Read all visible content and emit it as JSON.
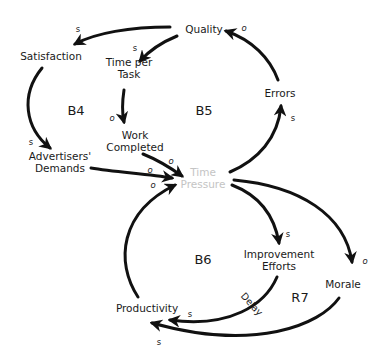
{
  "diagram": {
    "type": "causal-loop-diagram",
    "nodes": {
      "quality": "Quality",
      "satisfaction": "Satisfaction",
      "time_per_task_1": "Time per",
      "time_per_task_2": "Task",
      "work_completed_1": "Work",
      "work_completed_2": "Completed",
      "advertisers_demands_1": "Advertisers'",
      "advertisers_demands_2": "Demands",
      "errors": "Errors",
      "time_pressure_1": "Time",
      "time_pressure_2": "Pressure",
      "improvement_efforts_1": "Improvement",
      "improvement_efforts_2": "Efforts",
      "productivity": "Productivity",
      "morale": "Morale"
    },
    "loops": {
      "b4": "B4",
      "b5": "B5",
      "b6": "B6",
      "r7": "R7"
    },
    "delay_label": "Delay",
    "links": [
      {
        "from": "Quality",
        "to": "Satisfaction",
        "polarity": "s"
      },
      {
        "from": "Quality",
        "to": "Time per Task",
        "polarity": "s"
      },
      {
        "from": "Satisfaction",
        "to": "Advertisers' Demands",
        "polarity": "s"
      },
      {
        "from": "Time per Task",
        "to": "Work Completed",
        "polarity": "o"
      },
      {
        "from": "Work Completed",
        "to": "Time Pressure",
        "polarity": "o"
      },
      {
        "from": "Advertisers' Demands",
        "to": "Time Pressure",
        "polarity": "o"
      },
      {
        "from": "Productivity",
        "to": "Time Pressure",
        "polarity": "o"
      },
      {
        "from": "Time Pressure",
        "to": "Errors",
        "polarity": "s"
      },
      {
        "from": "Errors",
        "to": "Quality",
        "polarity": "o"
      },
      {
        "from": "Time Pressure",
        "to": "Improvement Efforts",
        "polarity": "s"
      },
      {
        "from": "Time Pressure",
        "to": "Morale",
        "polarity": "o"
      },
      {
        "from": "Improvement Efforts",
        "to": "Productivity",
        "polarity": "s",
        "delay": true
      },
      {
        "from": "Morale",
        "to": "Productivity",
        "polarity": "s"
      }
    ],
    "polarity_labels": {
      "q_sat": "s",
      "q_tpt": "s",
      "sat_adv": "s",
      "tpt_wc": "o",
      "wc_tp": "o",
      "adv_tp": "o",
      "prod_tp": "o",
      "tp_err": "s",
      "err_q": "o",
      "tp_ie": "s",
      "tp_mor": "o",
      "ie_prod": "s",
      "mor_prod": "s"
    },
    "colors": {
      "ink": "#1a1a1a",
      "faint_node": "#c4c4c4",
      "background": "#ffffff"
    }
  }
}
